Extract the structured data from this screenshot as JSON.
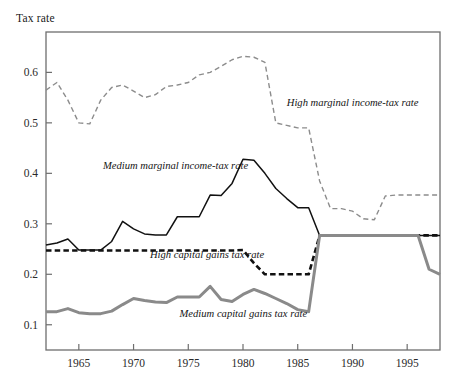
{
  "chart_data": {
    "type": "line",
    "title": "",
    "ylabel": "Tax rate",
    "xlabel": "",
    "xlim": [
      1962,
      1998
    ],
    "ylim": [
      0.05,
      0.68
    ],
    "grid": false,
    "legend_position": "inline-annotations",
    "xticks": [
      1965,
      1970,
      1975,
      1980,
      1985,
      1990,
      1995
    ],
    "xtick_labels": [
      "1965",
      "1970",
      "1975",
      "1980",
      "1985",
      "1990",
      "1995"
    ],
    "yticks": [
      0.1,
      0.2,
      0.3,
      0.4,
      0.5,
      0.6
    ],
    "ytick_labels": [
      "0.1",
      "0.2",
      "0.3",
      "0.4",
      "0.5",
      "0.6"
    ],
    "x": [
      1962,
      1963,
      1964,
      1965,
      1966,
      1967,
      1968,
      1969,
      1970,
      1971,
      1972,
      1973,
      1974,
      1975,
      1976,
      1977,
      1978,
      1979,
      1980,
      1981,
      1982,
      1983,
      1984,
      1985,
      1986,
      1987,
      1988,
      1989,
      1990,
      1991,
      1992,
      1993,
      1994,
      1995,
      1996,
      1997,
      1998
    ],
    "series": [
      {
        "name": "High marginal income-tax rate",
        "style": "dashed",
        "color": "#8c8c8c",
        "width": 1.4,
        "values": [
          0.565,
          0.58,
          0.545,
          0.5,
          0.498,
          0.545,
          0.57,
          0.575,
          0.563,
          0.55,
          0.556,
          0.572,
          0.575,
          0.58,
          0.595,
          0.6,
          0.612,
          0.625,
          0.632,
          0.63,
          0.62,
          0.5,
          0.495,
          0.49,
          0.49,
          0.385,
          0.33,
          0.33,
          0.325,
          0.31,
          0.308,
          0.355,
          0.357,
          0.357,
          0.357,
          0.357,
          0.357
        ]
      },
      {
        "name": "Medium marginal income-tax rate",
        "style": "solid",
        "color": "#111111",
        "width": 1.5,
        "values": [
          0.258,
          0.262,
          0.27,
          0.248,
          0.248,
          0.248,
          0.265,
          0.305,
          0.29,
          0.28,
          0.278,
          0.278,
          0.314,
          0.314,
          0.314,
          0.357,
          0.356,
          0.38,
          0.428,
          0.426,
          0.4,
          0.37,
          0.35,
          0.332,
          0.332,
          0.277,
          0.277,
          0.277,
          0.277,
          0.277,
          0.277,
          0.277,
          0.277,
          0.277,
          0.277,
          0.277,
          0.277
        ]
      },
      {
        "name": "High capital gains tax rate",
        "style": "dashed-bold",
        "color": "#111111",
        "width": 2.6,
        "values": [
          0.247,
          0.247,
          0.247,
          0.247,
          0.247,
          0.247,
          0.247,
          0.247,
          0.247,
          0.247,
          0.247,
          0.247,
          0.247,
          0.247,
          0.247,
          0.247,
          0.247,
          0.247,
          0.248,
          0.222,
          0.2,
          0.2,
          0.2,
          0.2,
          0.2,
          0.277,
          0.277,
          0.277,
          0.277,
          0.277,
          0.277,
          0.277,
          0.277,
          0.277,
          0.277,
          0.277,
          0.277
        ]
      },
      {
        "name": "Medium capital gains tax rate",
        "style": "solid-bold",
        "color": "#8a8a8a",
        "width": 3.0,
        "values": [
          0.126,
          0.126,
          0.132,
          0.124,
          0.122,
          0.122,
          0.127,
          0.14,
          0.152,
          0.148,
          0.145,
          0.144,
          0.155,
          0.155,
          0.155,
          0.176,
          0.15,
          0.146,
          0.16,
          0.17,
          0.162,
          0.152,
          0.142,
          0.13,
          0.126,
          0.277,
          0.277,
          0.277,
          0.277,
          0.277,
          0.277,
          0.277,
          0.277,
          0.277,
          0.277,
          0.21,
          0.2
        ]
      }
    ],
    "annotations": [
      {
        "text": "High marginal income-tax rate",
        "x": 1984.0,
        "y": 0.533
      },
      {
        "text": "Medium marginal income-tax rate",
        "x": 1967.2,
        "y": 0.408
      },
      {
        "text": "High capital gains tax rate",
        "x": 1971.5,
        "y": 0.232
      },
      {
        "text": "Medium capital gains tax rate",
        "x": 1974.2,
        "y": 0.116
      }
    ]
  },
  "frame": {
    "color": "#6e6e6e"
  }
}
